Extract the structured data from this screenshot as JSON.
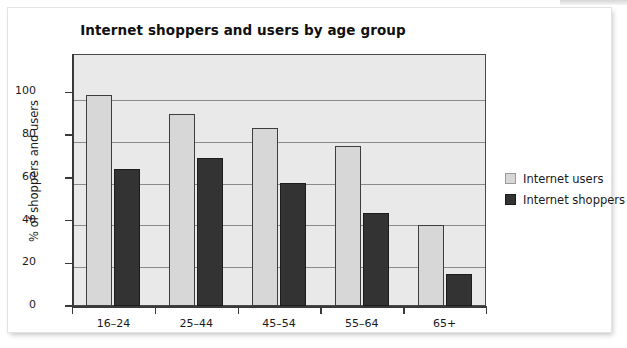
{
  "chart_data": {
    "type": "bar",
    "title": "Internet shoppers and users by age group",
    "xlabel": "",
    "ylabel": "% of shoppers and users",
    "categories": [
      "16–24",
      "25–44",
      "45–54",
      "55–64",
      "65+"
    ],
    "series": [
      {
        "name": "Internet users",
        "color": "#d7d7d7",
        "values": [
          99,
          90,
          83.5,
          75,
          38
        ]
      },
      {
        "name": "Internet shoppers",
        "color": "#333333",
        "values": [
          64,
          69.5,
          57.5,
          43.5,
          15
        ]
      }
    ],
    "ylim": [
      0,
      118
    ],
    "yticks": [
      0,
      20,
      40,
      60,
      80,
      100
    ],
    "ytick_labels": [
      "0",
      "20",
      "40",
      "60",
      "80",
      "100"
    ],
    "grid": true,
    "legend_position": "right",
    "plot_background": "#e9e9e9",
    "axis_color": "#3a3a3a"
  },
  "legend": {
    "items": [
      {
        "label": "Internet users"
      },
      {
        "label": "Internet shoppers"
      }
    ]
  }
}
